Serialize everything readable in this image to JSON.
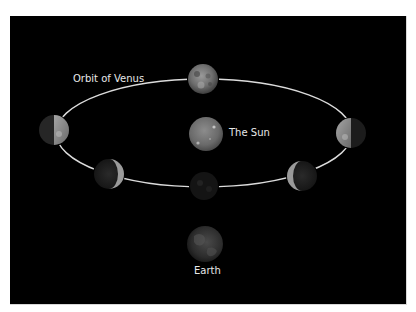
{
  "diagram": {
    "type": "orbital-phases",
    "background": "#000000",
    "labels": {
      "orbit": "Orbit of Venus",
      "sun": "The Sun",
      "earth": "Earth"
    },
    "orbit": {
      "cx": 204,
      "cy": 133,
      "rx": 148,
      "ry": 54,
      "color": "#e0e0e0"
    },
    "sun": {
      "cx": 206,
      "cy": 134,
      "r": 17
    },
    "earth": {
      "cx": 205,
      "cy": 244,
      "r": 18
    },
    "venus_positions": [
      {
        "name": "venus-top-full",
        "cx": 203,
        "cy": 79,
        "r": 15,
        "phase": "full"
      },
      {
        "name": "venus-left-half",
        "cx": 54,
        "cy": 130,
        "r": 15,
        "phase": "half-lit-right"
      },
      {
        "name": "venus-right-half",
        "cx": 351,
        "cy": 133,
        "r": 15,
        "phase": "half-lit-left"
      },
      {
        "name": "venus-lower-left-crescent",
        "cx": 109,
        "cy": 174,
        "r": 15,
        "phase": "crescent-right"
      },
      {
        "name": "venus-lower-right-crescent",
        "cx": 302,
        "cy": 176,
        "r": 15,
        "phase": "crescent-left"
      },
      {
        "name": "venus-bottom-new",
        "cx": 204,
        "cy": 186,
        "r": 15,
        "phase": "new"
      }
    ]
  }
}
